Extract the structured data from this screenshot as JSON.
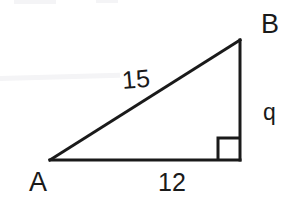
{
  "figure": {
    "type": "right-triangle-diagram",
    "background_color": "#ffffff",
    "stroke_color": "#1a1a1a",
    "stroke_width": 3,
    "width": 298,
    "height": 207,
    "vertices": {
      "A": {
        "x": 50,
        "y": 160,
        "label": "A"
      },
      "B": {
        "x": 240,
        "y": 40,
        "label": "B"
      },
      "C": {
        "x": 240,
        "y": 160,
        "label": ""
      }
    },
    "sides": [
      {
        "name": "hypotenuse",
        "from": "A",
        "to": "B",
        "label": "15"
      },
      {
        "name": "vertical-leg",
        "from": "B",
        "to": "C",
        "label": "q"
      },
      {
        "name": "base-leg",
        "from": "A",
        "to": "C",
        "label": "12"
      }
    ],
    "right_angle": {
      "at": "C",
      "marker": "square",
      "size": 22
    },
    "labels": {
      "vertex_b": "B",
      "vertex_a": "A",
      "side_hypotenuse": "15",
      "side_vertical": "q",
      "side_base": "12"
    },
    "artifacts": {
      "top_left": "",
      "top_right": "",
      "streak": ""
    }
  }
}
